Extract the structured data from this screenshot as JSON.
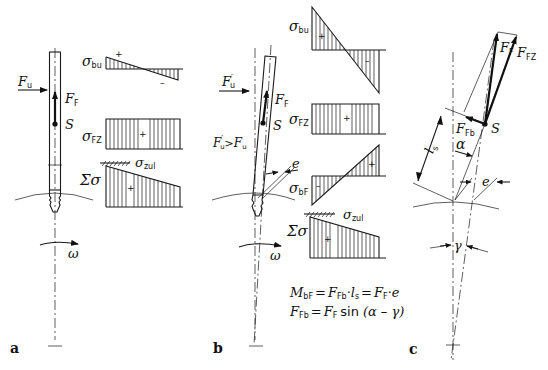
{
  "figure": {
    "panels": [
      {
        "id": "a",
        "label": "a"
      },
      {
        "id": "b",
        "label": "b"
      },
      {
        "id": "c",
        "label": "c"
      }
    ]
  },
  "panel_a": {
    "force_label": "F",
    "force_sub": "u",
    "ff_label": "F",
    "ff_sub": "F",
    "s_label": "S",
    "omega": "ω",
    "diagrams": {
      "bu": {
        "sym": "σ",
        "sub": "bu",
        "plus": "+",
        "minus": "–"
      },
      "fz": {
        "sym": "σ",
        "sub": "FZ",
        "plus": "+"
      },
      "sum": {
        "sym": "Σσ",
        "plus": "+"
      },
      "zul": {
        "sym": "σ",
        "sub": "zul"
      }
    }
  },
  "panel_b": {
    "force_label": "F",
    "force_sub": "u",
    "prime": "′",
    "ff_label": "F",
    "ff_sub": "F",
    "s_label": "S",
    "cond_left": "F",
    "cond_left_sub": "u",
    "cond_op": ">",
    "cond_right": "F",
    "cond_right_sub": "u",
    "e_label": "e",
    "omega": "ω",
    "diagrams": {
      "bu": {
        "sym": "σ",
        "sub": "bu",
        "plus": "+",
        "minus": "–"
      },
      "fz": {
        "sym": "σ",
        "sub": "FZ",
        "plus": "+"
      },
      "bf": {
        "sym": "σ",
        "sub": "bF",
        "plus": "+",
        "minus": "–"
      },
      "sum": {
        "sym": "Σσ",
        "plus": "+"
      },
      "zul": {
        "sym": "σ",
        "sub": "zul"
      }
    },
    "equations": [
      "M_bF = F_Fb · l_s = F_F · e",
      "F_Fb = F_F sin (α – γ)"
    ],
    "eq1": {
      "M": "M",
      "M_sub": "bF",
      "eq": "=",
      "Ffb": "F",
      "Ffb_sub": "Fb",
      "dot": "·",
      "l": "l",
      "l_sub": "s",
      "eq2": "=",
      "Ff": "F",
      "Ff_sub": "F",
      "dot2": "·",
      "e": "e"
    },
    "eq2": {
      "Ffb": "F",
      "Ffb_sub": "Fb",
      "eq": "=",
      "Ff": "F",
      "Ff_sub": "F",
      "fn": "sin",
      "arg": "(α – γ)"
    }
  },
  "panel_c": {
    "ff_label": "F",
    "ff_sub": "F",
    "ffz_label": "F",
    "ffz_sub": "FZ",
    "ffb_label": "F",
    "ffb_sub": "Fb",
    "s_label": "S",
    "ls_label": "l",
    "ls_sub": "s",
    "alpha": "α",
    "e_label": "e",
    "gamma": "γ"
  }
}
